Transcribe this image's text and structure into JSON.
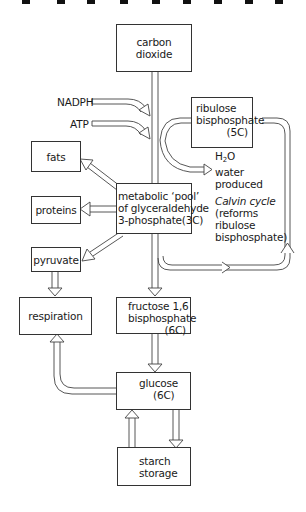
{
  "diagram": {
    "title": "",
    "nodes": {
      "carbon_dioxide": {
        "line1": "carbon",
        "line2": "dioxide"
      },
      "ribulose": {
        "line1": "ribulose",
        "line2": "bisphosphate",
        "line3": "(5C)"
      },
      "fats": {
        "label": "fats"
      },
      "proteins": {
        "label": "proteins"
      },
      "pool": {
        "line1": "metabolic ‘pool’",
        "line2": "of glyceraldehyde",
        "line3": "3-phosphate(3C)"
      },
      "pyruvate": {
        "label": "pyruvate"
      },
      "respiration": {
        "label": "respiration"
      },
      "fructose": {
        "line1": "fructose 1,6",
        "line2": "bisphosphate",
        "line3": "(6C)"
      },
      "glucose": {
        "line1": "glucose",
        "line2": "(6C)"
      },
      "starch": {
        "line1": "starch",
        "line2": "storage"
      }
    },
    "inputs": {
      "nadph": "NADPH",
      "atp": "ATP"
    },
    "annotations": {
      "water_formula_h": "H",
      "water_formula_sub": "2",
      "water_formula_o": "O",
      "water_line2": "water",
      "water_line3": "produced",
      "calvin_line1": "Calvin cycle",
      "calvin_line2": "(reforms",
      "calvin_line3": "ribulose",
      "calvin_line4": "bisphosphate)"
    },
    "edges": [
      [
        "carbon_dioxide",
        "pool"
      ],
      [
        "nadph",
        "pool"
      ],
      [
        "atp",
        "pool"
      ],
      [
        "ribulose",
        "pool"
      ],
      [
        "pool",
        "water"
      ],
      [
        "pool",
        "fats"
      ],
      [
        "pool",
        "proteins"
      ],
      [
        "pool",
        "pyruvate"
      ],
      [
        "pool",
        "fructose"
      ],
      [
        "pool",
        "ribulose"
      ],
      [
        "pyruvate",
        "respiration"
      ],
      [
        "fructose",
        "glucose"
      ],
      [
        "glucose",
        "respiration"
      ],
      [
        "glucose",
        "starch"
      ],
      [
        "starch",
        "glucose"
      ]
    ]
  }
}
